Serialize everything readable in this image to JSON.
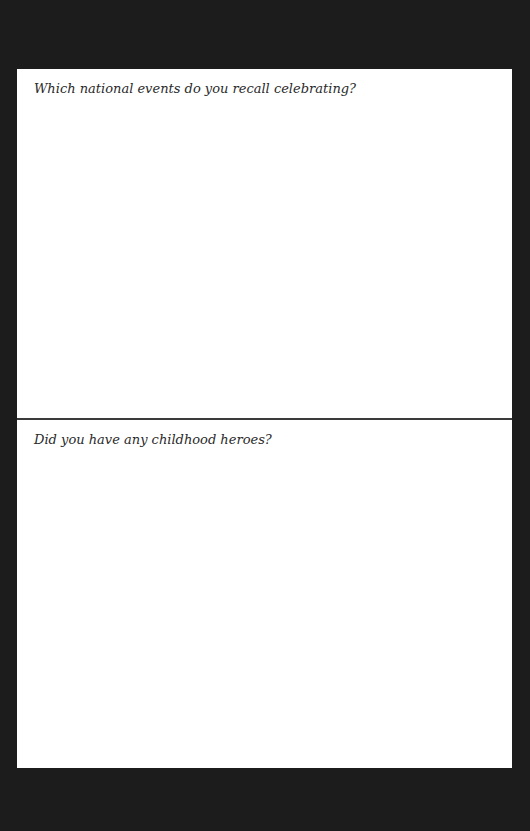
{
  "page": {
    "sections": [
      {
        "prompt": "Which national events do you recall celebrating?",
        "answer": ""
      },
      {
        "prompt": "Did you have any childhood heroes?",
        "answer": ""
      }
    ]
  },
  "colors": {
    "background": "#1c1c1c",
    "page": "#ffffff",
    "divider": "#3a3a3a",
    "text": "#2a2a2a"
  }
}
